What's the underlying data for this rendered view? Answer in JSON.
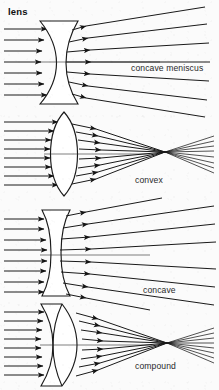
{
  "title": "lens",
  "page": {
    "background_color": "#fbfbfb",
    "ink_color": "#1a1a1a",
    "width": 219,
    "height": 390
  },
  "diagrams": [
    {
      "id": "concave-meniscus",
      "label": "concave meniscus",
      "lens_type": "concave meniscus",
      "behavior": "diverging",
      "incoming_rays": 7,
      "outgoing_rays": 7,
      "has_focal_point": false,
      "label_x": 131,
      "label_y": 71
    },
    {
      "id": "convex",
      "label": "convex",
      "lens_type": "biconvex",
      "behavior": "converging",
      "incoming_rays": 8,
      "outgoing_rays": 8,
      "has_focal_point": true,
      "focal_x": 165,
      "focal_y": 152,
      "label_x": 135,
      "label_y": 183
    },
    {
      "id": "concave",
      "label": "concave",
      "lens_type": "biconcave",
      "behavior": "diverging",
      "incoming_rays": 8,
      "outgoing_rays": 8,
      "has_focal_point": false,
      "label_x": 143,
      "label_y": 293
    },
    {
      "id": "compound",
      "label": "compound",
      "lens_type": "cemented doublet",
      "behavior": "converging",
      "incoming_rays": 8,
      "outgoing_rays": 8,
      "has_focal_point": true,
      "focal_x": 167,
      "focal_y": 343,
      "label_x": 135,
      "label_y": 369
    }
  ]
}
